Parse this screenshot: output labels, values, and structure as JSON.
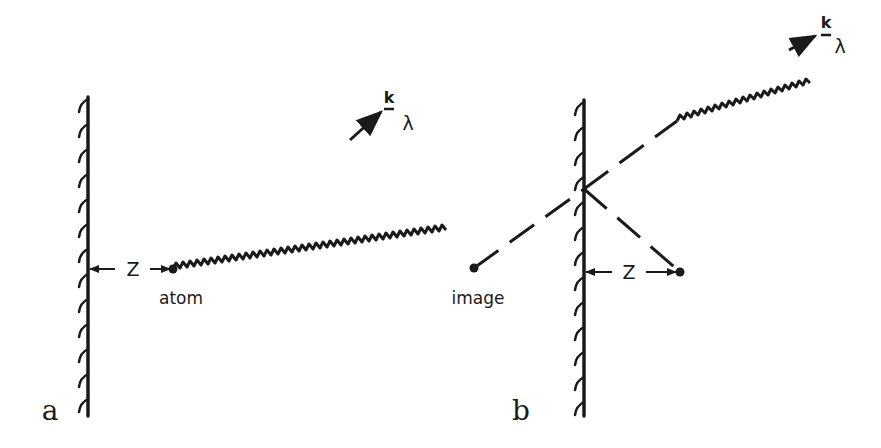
{
  "figure": {
    "colors": {
      "ink": "#1a1a1a",
      "background": "#ffffff"
    },
    "panels": [
      {
        "id": "a",
        "panel_label": "a",
        "atom_label": "atom",
        "distance_label": "Z",
        "wavevector_label": "k",
        "polarization_label": "λ",
        "elements": [
          "mirror-wall",
          "atom",
          "distance-arrow-Z",
          "emitted-photon-wavy-arrow"
        ]
      },
      {
        "id": "b",
        "panel_label": "b",
        "image_label": "image",
        "distance_label": "Z",
        "wavevector_label": "k",
        "polarization_label": "λ",
        "elements": [
          "mirror-wall",
          "atom",
          "image-atom",
          "distance-arrow-Z",
          "dashed-reflected-path",
          "emitted-photon-wavy-arrow"
        ]
      }
    ]
  }
}
